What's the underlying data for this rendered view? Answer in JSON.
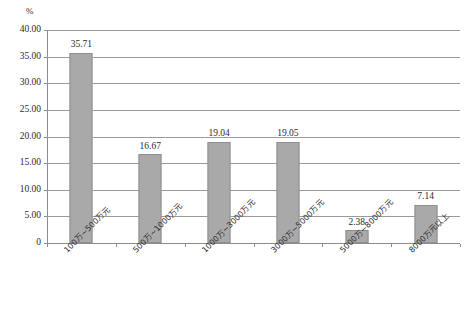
{
  "chart_data": {
    "type": "bar",
    "title": "",
    "subtitle": "",
    "unit_label": "%",
    "xlabel": "",
    "ylabel": "",
    "ylim": [
      0,
      40
    ],
    "ytick_step": 5,
    "grid": true,
    "legend": false,
    "legend_position": "none",
    "orientation": "vertical",
    "categories": [
      "100万~500万元",
      "500万~1000万元",
      "1000万~3000万元",
      "3000万~5000万元",
      "5000万~8000万元",
      "8000万元以上"
    ],
    "values": [
      35.71,
      16.67,
      19.04,
      19.05,
      2.38,
      7.14
    ],
    "value_labels": [
      "35.71",
      "16.67",
      "19.04",
      "19.05",
      "2.38",
      "7.14"
    ],
    "ytick_labels": [
      "0",
      "5.00",
      "10.00",
      "15.00",
      "20.00",
      "25.00",
      "30.00",
      "35.00",
      "40.00"
    ],
    "ytick_values": [
      0,
      5,
      10,
      15,
      20,
      25,
      30,
      35,
      40
    ],
    "colors": {
      "bar_fill": "#a9a9a9",
      "bar_border": "#8f8f8f",
      "gridline": "#9a9a9a",
      "axis": "#8c8c8c",
      "text": "#2b2b2b",
      "background": "#ffffff"
    }
  },
  "caption": {
    "text": ""
  }
}
